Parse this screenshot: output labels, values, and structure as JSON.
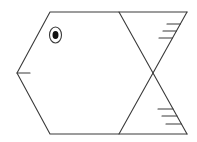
{
  "figure": {
    "parts": [
      {
        "name": "body",
        "shape": "hexagon"
      },
      {
        "name": "eye",
        "shape": "concentric ellipses"
      },
      {
        "name": "mouth",
        "shape": "line"
      },
      {
        "name": "tail",
        "shape": "two triangles meeting at a point"
      },
      {
        "name": "upper-fin-stripes",
        "count": 3
      },
      {
        "name": "lower-fin-stripes",
        "count": 3
      }
    ],
    "colors": {
      "stroke": "#3a3a3a",
      "pupil": "#111111",
      "background": "#ffffff"
    }
  }
}
